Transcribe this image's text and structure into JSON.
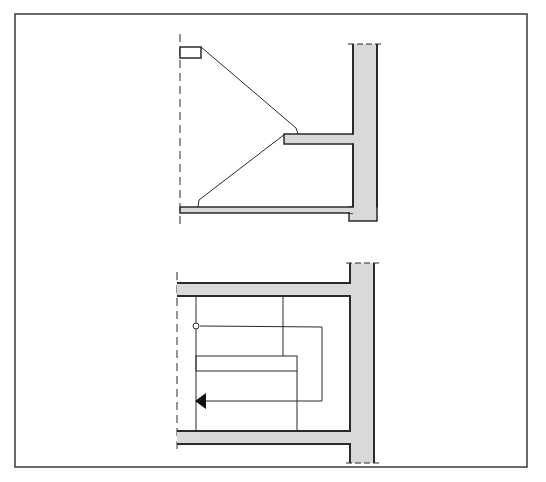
{
  "diagram": {
    "title": "",
    "colors": {
      "background": "#ffffff",
      "line": "#2a2a2a",
      "fill": "#d9d9d9",
      "frame": "#3a3a3a"
    },
    "frame": {
      "x": 15,
      "y": 14,
      "width": 512,
      "height": 453
    },
    "section_view": {
      "label": "",
      "centerline": {
        "x": 180,
        "y1": 34,
        "y2": 228
      },
      "top_block": {
        "x": 180,
        "y": 47,
        "width": 21,
        "height": 11
      },
      "wall": {
        "x": 353,
        "y": 44,
        "width": 24,
        "height": 164
      },
      "landing_slab": {
        "x": 284,
        "y": 134,
        "width": 69,
        "height": 10
      },
      "floor_slab": {
        "x": 180,
        "y": 207,
        "width": 173,
        "height": 6
      },
      "footing": {
        "x": 349,
        "y": 207,
        "width": 28,
        "height": 14
      }
    },
    "plan_view": {
      "label": "",
      "centerline": {
        "x": 177,
        "y1": 270,
        "y2": 450
      },
      "wall": {
        "x": 350,
        "y": 263,
        "width": 24,
        "height": 200
      },
      "top_slab": {
        "x": 177,
        "y": 282,
        "width": 173,
        "height": 14
      },
      "bottom_slab": {
        "x": 177,
        "y": 430,
        "width": 173,
        "height": 14
      },
      "start_marker": "circle",
      "direction_arrow": "arrow-left"
    }
  }
}
